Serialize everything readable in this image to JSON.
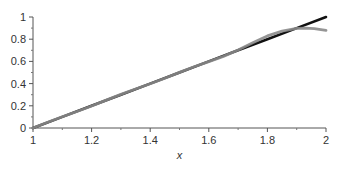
{
  "chart_data": {
    "type": "line",
    "title": "",
    "xlabel": "x",
    "ylabel": "",
    "xlim": [
      1,
      2
    ],
    "ylim": [
      0,
      1
    ],
    "grid": false,
    "legend": "none",
    "x_ticks": [
      1,
      1.2,
      1.4,
      1.6,
      1.8,
      2
    ],
    "x_tick_labels": [
      "1",
      "1.2",
      "1.4",
      "1.6",
      "1.8",
      "2"
    ],
    "y_ticks": [
      0,
      0.2,
      0.4,
      0.6,
      0.8,
      1
    ],
    "y_tick_labels": [
      "0",
      "0.2",
      "0.4",
      "0.6",
      "0.8",
      "1"
    ],
    "series": [
      {
        "name": "exact",
        "color": "#111111",
        "x": [
          1,
          1.1,
          1.2,
          1.3,
          1.4,
          1.5,
          1.6,
          1.7,
          1.8,
          1.9,
          2
        ],
        "y": [
          0,
          0.1,
          0.2,
          0.3,
          0.4,
          0.5,
          0.6,
          0.7,
          0.8,
          0.9,
          1.0
        ]
      },
      {
        "name": "approximation",
        "color": "#8a8a8a",
        "x": [
          1,
          1.05,
          1.1,
          1.15,
          1.2,
          1.25,
          1.3,
          1.35,
          1.4,
          1.45,
          1.5,
          1.55,
          1.6,
          1.65,
          1.7,
          1.75,
          1.8,
          1.85,
          1.9,
          1.93,
          1.96,
          2
        ],
        "y": [
          0,
          0.052,
          0.102,
          0.149,
          0.198,
          0.251,
          0.303,
          0.351,
          0.398,
          0.449,
          0.501,
          0.552,
          0.598,
          0.645,
          0.703,
          0.768,
          0.83,
          0.872,
          0.897,
          0.9,
          0.895,
          0.88
        ]
      }
    ]
  }
}
